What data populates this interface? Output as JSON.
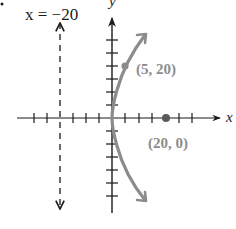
{
  "diagram": {
    "type": "parabola-graph",
    "equation_context": "Parabola with vertex at origin, focus (20, 0), directrix x = -20, opening right",
    "directrix_label": "x = −20",
    "x_axis_label": "x",
    "y_axis_label": "y",
    "points": [
      {
        "label": "(5, 20)",
        "x": 5,
        "y": 20
      },
      {
        "label": "(20, 0)",
        "x": 20,
        "y": 0
      }
    ],
    "focus": {
      "x": 20,
      "y": 0
    },
    "directrix_x": -20,
    "tick_spacing": 5,
    "x_ticks_range": [
      -25,
      20
    ],
    "y_ticks_range": [
      -30,
      30
    ],
    "colors": {
      "axes": "#1a1a1a",
      "curve": "#8c8c8c",
      "point_label": "#8c8c8c",
      "directrix": "#1a1a1a"
    }
  }
}
